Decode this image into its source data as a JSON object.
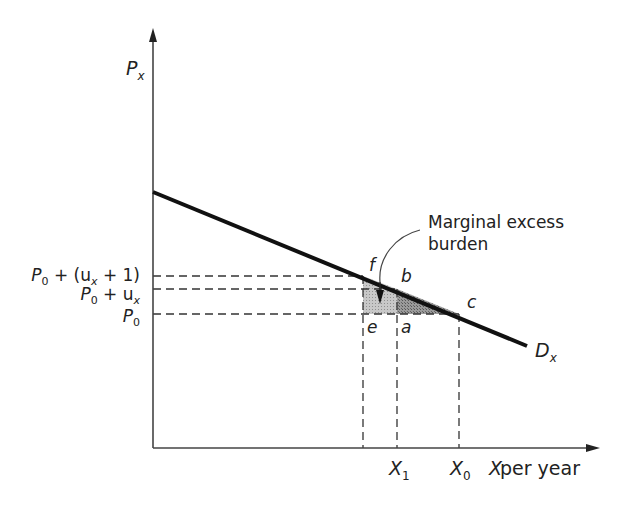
{
  "diagram": {
    "axes": {
      "y_label": "P",
      "y_label_sub": "x",
      "x_label_var": "X",
      "x_label_rest": " per year"
    },
    "price_levels": [
      {
        "id": "p_top",
        "label_main": "P",
        "label_sub": "0",
        "label_rest": " + (u",
        "label_sub2": "x",
        "label_tail": " + 1)"
      },
      {
        "id": "p_mid",
        "label_main": "P",
        "label_sub": "0",
        "label_rest": " + u",
        "label_sub2": "x"
      },
      {
        "id": "p0",
        "label_main": "P",
        "label_sub": "0"
      }
    ],
    "quantity_levels": [
      {
        "id": "x1",
        "label_main": "X",
        "label_sub": "1"
      },
      {
        "id": "x0",
        "label_main": "X",
        "label_sub": "0"
      }
    ],
    "curve": {
      "label_main": "D",
      "label_sub": "x"
    },
    "points": {
      "f": "f",
      "b": "b",
      "c": "c",
      "e": "e",
      "a": "a"
    },
    "annotation": {
      "line1": "Marginal excess",
      "line2": "burden"
    },
    "colors": {
      "line": "#111111",
      "shade_light": "#b5b5b5",
      "shade_dark": "#8a8a8a",
      "dash": "#333333"
    }
  }
}
